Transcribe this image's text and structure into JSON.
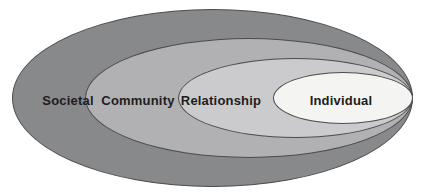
{
  "diagram": {
    "type": "nested-ellipse-model",
    "background": "#ffffff",
    "outline_color": "#4c4c4e",
    "text_color": "#1d1d1d",
    "levels": [
      {
        "label": "Societal",
        "fill": "#88898b"
      },
      {
        "label": "Community",
        "fill": "#b1b1b3"
      },
      {
        "label": "Relationship",
        "fill": "#cbcbcd"
      },
      {
        "label": "Individual",
        "fill": "#f4f4f2"
      }
    ]
  }
}
